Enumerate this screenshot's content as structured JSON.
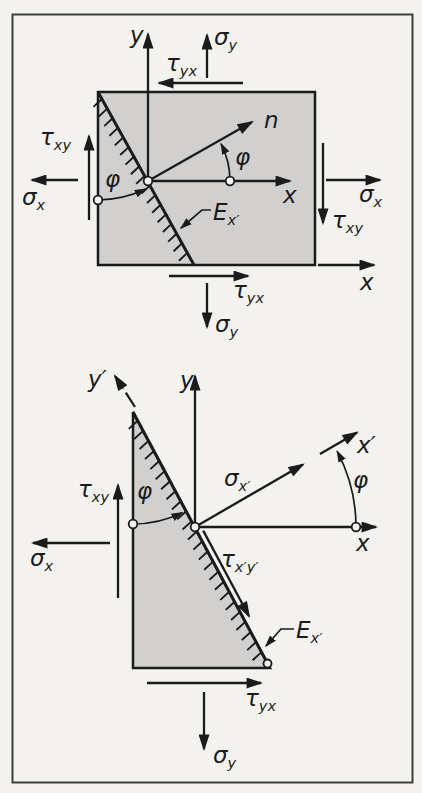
{
  "figure": {
    "colors": {
      "element_fill": "#d1d0ce",
      "line": "#1b1b1b",
      "paper": "#f3f2ef",
      "frame": "#3e3e3e"
    },
    "top": {
      "labels": {
        "y_axis": {
          "base": "y"
        },
        "sigma_y_top": {
          "base": "σ",
          "sub": "y"
        },
        "tau_yx_top": {
          "base": "τ",
          "sub": "yx"
        },
        "n_axis": {
          "base": "n"
        },
        "phi_right": {
          "base": "φ"
        },
        "phi_left": {
          "base": "φ"
        },
        "x_axis": {
          "base": "x"
        },
        "sigma_x_left": {
          "base": "σ",
          "sub": "x"
        },
        "tau_xy_left": {
          "base": "τ",
          "sub": "xy"
        },
        "sigma_x_right": {
          "base": "σ",
          "sub": "x"
        },
        "tau_xy_right": {
          "base": "τ",
          "sub": "xy"
        },
        "cut_plane": {
          "base": "E",
          "sub": "x′"
        },
        "x_axis_outer": {
          "base": "x"
        },
        "tau_yx_bottom": {
          "base": "τ",
          "sub": "yx"
        },
        "sigma_y_bottom": {
          "base": "σ",
          "sub": "y"
        }
      }
    },
    "bottom": {
      "labels": {
        "y_prime_axis": {
          "base": "y′"
        },
        "y_axis": {
          "base": "y"
        },
        "x_prime_axis": {
          "base": "x′"
        },
        "sigma_x_prime": {
          "base": "σ",
          "sub": "x′"
        },
        "phi_right": {
          "base": "φ"
        },
        "phi_inner": {
          "base": "φ"
        },
        "x_axis": {
          "base": "x"
        },
        "tau_xy_left": {
          "base": "τ",
          "sub": "xy"
        },
        "sigma_x_left": {
          "base": "σ",
          "sub": "x"
        },
        "tau_xpyp": {
          "base": "τ",
          "sub": "x′y′"
        },
        "cut_plane": {
          "base": "E",
          "sub": "x′"
        },
        "tau_yx_bottom": {
          "base": "τ",
          "sub": "yx"
        },
        "sigma_y_bottom": {
          "base": "σ",
          "sub": "y"
        }
      }
    }
  }
}
